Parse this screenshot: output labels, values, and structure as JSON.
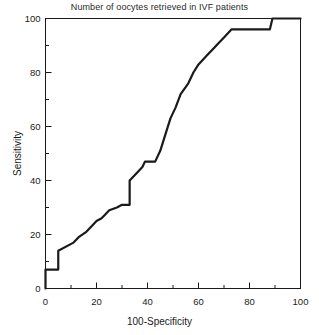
{
  "chart_data": {
    "type": "line",
    "title": "Number of oocytes retrieved in IVF patients",
    "xlabel": "100-Specificity",
    "ylabel": "Sensitivity",
    "xlim": [
      0,
      100
    ],
    "ylim": [
      0,
      100
    ],
    "grid": false,
    "legend": null,
    "xticks": [
      0,
      20,
      40,
      60,
      80,
      100
    ],
    "xtick_labels": [
      "0",
      "20",
      "40",
      "60",
      "80",
      "100"
    ],
    "x_minor_ticks": [
      10,
      30,
      50,
      70,
      90
    ],
    "yticks": [
      0,
      20,
      40,
      60,
      80,
      100
    ],
    "ytick_labels": [
      "0",
      "20",
      "40",
      "60",
      "80",
      "100"
    ],
    "y_minor_ticks": [
      10,
      30,
      50,
      70,
      90
    ],
    "series": [
      {
        "name": "ROC curve",
        "color": "#1a1a1a",
        "line_width": 2.2,
        "x": [
          0,
          0,
          2,
          2,
          5,
          5,
          11,
          13,
          16,
          18,
          20,
          22,
          24,
          25,
          28,
          30,
          33,
          33,
          36,
          38,
          39,
          41,
          43,
          45,
          47,
          49,
          51,
          53,
          56,
          58,
          60,
          62,
          64,
          66,
          68,
          70,
          72,
          73,
          88,
          89,
          100
        ],
        "y": [
          0,
          7,
          7,
          7,
          7,
          14,
          17,
          19,
          21,
          23,
          25,
          26,
          28,
          29,
          30,
          31,
          31,
          40,
          43,
          45,
          47,
          47,
          47,
          51,
          57,
          63,
          67,
          72,
          76,
          80,
          83,
          85,
          87,
          89,
          91,
          93,
          95,
          96,
          96,
          100,
          100
        ]
      }
    ]
  }
}
